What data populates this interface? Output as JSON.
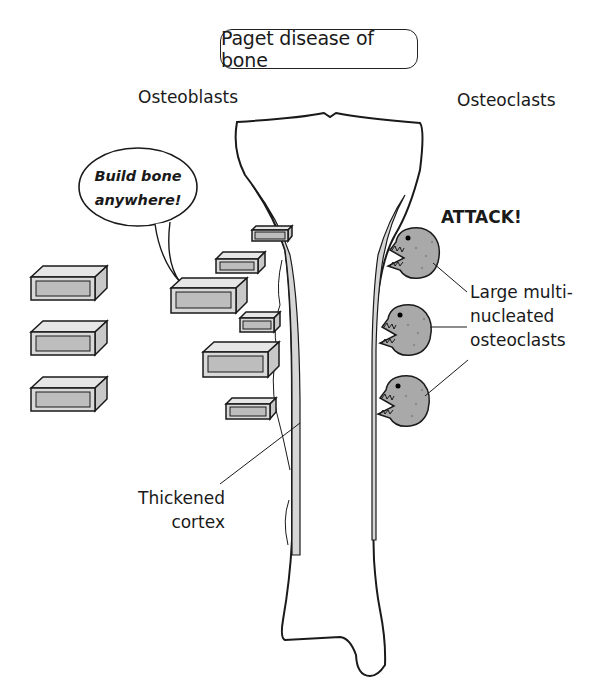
{
  "title": "Paget disease of bone",
  "labels": {
    "osteoblasts": "Osteoblasts",
    "osteoclasts": "Osteoclasts",
    "speech_bubble_line1": "Build bone",
    "speech_bubble_line2": "anywhere!",
    "attack": "ATTACK!",
    "osteoclast_desc_line1": "Large multi-",
    "osteoclast_desc_line2": "nucleated",
    "osteoclast_desc_line3": "osteoclasts",
    "cortex_line1": "Thickened",
    "cortex_line2": "cortex"
  },
  "elements": {
    "bone": "tibia-like long bone (stylized)",
    "osteoblast_bricks": 9,
    "osteoclast_creatures": 3
  },
  "colors": {
    "outline": "#1a1a1a",
    "cortex_fill": "#d6d6d6",
    "brick_fill": "#d9d9d9",
    "brick_inner": "#bdbdbd",
    "osteoclast_fill": "#a9a9a9",
    "background": "#ffffff"
  }
}
